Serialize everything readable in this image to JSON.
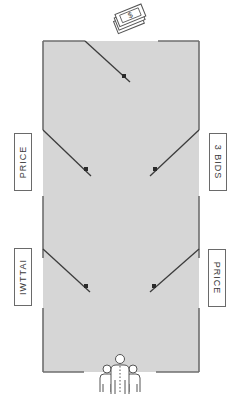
{
  "diagram": {
    "colors": {
      "floor": "#d6d6d6",
      "wall": "#6e6e6e",
      "door": "#3c3c3c",
      "hinge_dot": "#2a2a2a",
      "label_border": "#6a6a6a",
      "label_text": "#3a3a3a"
    },
    "top_icon": {
      "name": "money-stack-icon",
      "symbol": "$"
    },
    "bottom_icon": {
      "name": "people-group-icon"
    },
    "labels": {
      "left_upper": "PRICE",
      "left_lower": "IWTTAI",
      "right_upper": "3 BIDS",
      "right_lower": "PRICE"
    }
  }
}
